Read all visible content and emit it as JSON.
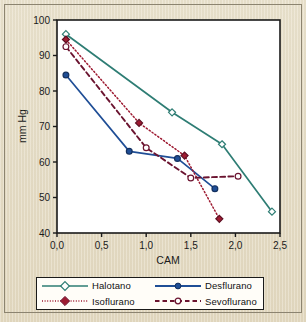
{
  "chart_data": {
    "type": "line",
    "title": "",
    "xlabel": "CAM",
    "ylabel": "mm Hg",
    "xlim": [
      0.0,
      2.5
    ],
    "ylim": [
      40,
      100
    ],
    "xticks": [
      "0,0",
      "0,5",
      "1,0",
      "1,5",
      "2,0",
      "2,5"
    ],
    "xtick_values": [
      0.0,
      0.5,
      1.0,
      1.5,
      2.0,
      2.5
    ],
    "yticks": [
      "40",
      "50",
      "60",
      "70",
      "80",
      "90",
      "100"
    ],
    "ytick_values": [
      40,
      50,
      60,
      70,
      80,
      90,
      100
    ],
    "grid": false,
    "legend_position": "bottom",
    "series": [
      {
        "name": "Halotano",
        "color": "#2e7d74",
        "marker": "open-diamond",
        "linestyle": "solid",
        "x": [
          0.1,
          1.29,
          1.85,
          2.41
        ],
        "y": [
          96.0,
          74.0,
          65.0,
          46.0
        ]
      },
      {
        "name": "Desflurano",
        "color": "#1f4e96",
        "marker": "filled-circle",
        "linestyle": "solid",
        "x": [
          0.1,
          0.81,
          1.35,
          1.77
        ],
        "y": [
          84.5,
          63.0,
          61.0,
          52.5
        ]
      },
      {
        "name": "Isoflurano",
        "color": "#9e1b32",
        "marker": "filled-diamond",
        "linestyle": "dotted",
        "x": [
          0.1,
          0.92,
          1.43,
          1.82
        ],
        "y": [
          94.5,
          71.0,
          61.8,
          44.0
        ]
      },
      {
        "name": "Sevoflurano",
        "color": "#6b1430",
        "marker": "open-circle",
        "linestyle": "dashed",
        "x": [
          0.1,
          1.0,
          1.5,
          2.03
        ],
        "y": [
          92.5,
          64.0,
          55.5,
          56.0
        ]
      }
    ]
  },
  "legend": {
    "items": [
      {
        "label": "Halotano"
      },
      {
        "label": "Desflurano"
      },
      {
        "label": "Isoflurano"
      },
      {
        "label": "Sevoflurano"
      }
    ]
  },
  "colors": {
    "halotano": "#2e7d74",
    "desflurano": "#1f4e96",
    "isoflurano": "#9e1b32",
    "sevoflurano": "#6b1430",
    "paper": "#e6ddc6",
    "plot_bg": "#ffffff",
    "frame": "#1a1a1a"
  }
}
